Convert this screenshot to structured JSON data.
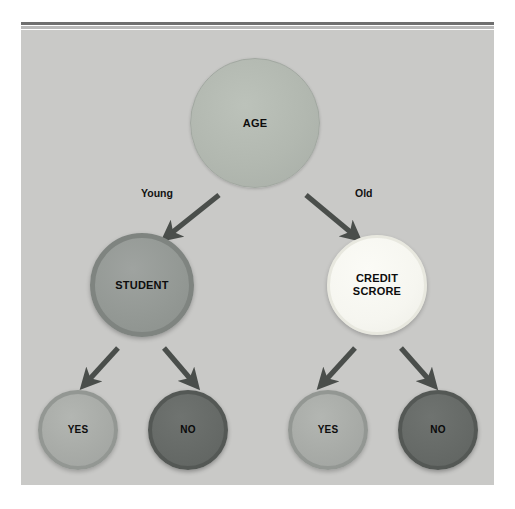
{
  "diagram": {
    "type": "decision-tree",
    "title": "",
    "background_color": "#c9c9c7",
    "page_background_color": "#ffffff",
    "accent_colors": {
      "top_bar_dark": "#6f6f6f",
      "top_bar_light": "#b9b9b9",
      "arrow": "#4a4e4b",
      "root_node": "#b2b8b0",
      "student_node": "#949995",
      "credit_node": "#f6f6f0",
      "yes_node": "#a8aba7",
      "no_node": "#666a67"
    },
    "nodes": [
      {
        "id": "age",
        "label": "AGE",
        "kind": "root",
        "shape": "circle",
        "cx": 234,
        "cy": 93,
        "r": 65,
        "fill": "#b2b8b0"
      },
      {
        "id": "student",
        "label": "STUDENT",
        "kind": "decision",
        "shape": "circle",
        "cx": 121,
        "cy": 255,
        "r": 52,
        "fill": "#949995"
      },
      {
        "id": "credit-scrore",
        "label_line1": "CREDIT",
        "label_line2": "SCRORE",
        "kind": "decision",
        "shape": "circle",
        "cx": 356,
        "cy": 255,
        "r": 50,
        "fill": "#f6f6f0"
      },
      {
        "id": "leaf-yes-left",
        "label": "YES",
        "kind": "leaf",
        "shape": "circle",
        "cx": 57,
        "cy": 400,
        "r": 40,
        "fill": "#a8aba7"
      },
      {
        "id": "leaf-no-left",
        "label": "NO",
        "kind": "leaf",
        "shape": "circle",
        "cx": 167,
        "cy": 400,
        "r": 40,
        "fill": "#666a67"
      },
      {
        "id": "leaf-yes-right",
        "label": "YES",
        "kind": "leaf",
        "shape": "circle",
        "cx": 307,
        "cy": 400,
        "r": 40,
        "fill": "#a8aba7"
      },
      {
        "id": "leaf-no-right",
        "label": "NO",
        "kind": "leaf",
        "shape": "circle",
        "cx": 417,
        "cy": 400,
        "r": 40,
        "fill": "#666a67"
      }
    ],
    "edges": [
      {
        "id": "edge-age-student",
        "from": "age",
        "to": "student",
        "label": "Young",
        "label_x": 120,
        "label_y": 163,
        "x1": 198,
        "y1": 165,
        "x2": 148,
        "y2": 205
      },
      {
        "id": "edge-age-credit",
        "from": "age",
        "to": "credit-scrore",
        "label": "Old",
        "label_x": 334,
        "label_y": 163,
        "x1": 285,
        "y1": 165,
        "x2": 333,
        "y2": 205
      },
      {
        "id": "edge-student-yes",
        "from": "student",
        "to": "leaf-yes-left",
        "label": "",
        "x1": 97,
        "y1": 318,
        "x2": 66,
        "y2": 352
      },
      {
        "id": "edge-student-no",
        "from": "student",
        "to": "leaf-no-left",
        "label": "",
        "x1": 143,
        "y1": 318,
        "x2": 172,
        "y2": 352
      },
      {
        "id": "edge-credit-yes",
        "from": "credit-scrore",
        "to": "leaf-yes-right",
        "label": "",
        "x1": 334,
        "y1": 318,
        "x2": 303,
        "y2": 352
      },
      {
        "id": "edge-credit-no",
        "from": "credit-scrore",
        "to": "leaf-no-right",
        "label": "",
        "x1": 380,
        "y1": 318,
        "x2": 410,
        "y2": 352
      }
    ]
  }
}
